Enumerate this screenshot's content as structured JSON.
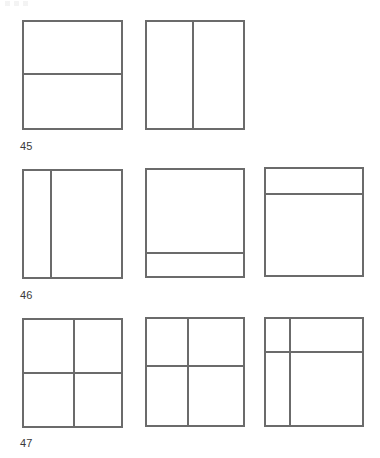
{
  "page": {
    "width": 380,
    "height": 458,
    "background_color": "#ffffff",
    "line_color": "#6b6b6b",
    "label_color": "#3a3a3a"
  },
  "rows": [
    {
      "label": "45",
      "label_x": 20,
      "label_y": 140,
      "figures": [
        {
          "name": "figure-45-a",
          "description": "square divided by one horizontal line into two horizontal bands",
          "x": 22,
          "y": 20,
          "width": 101,
          "height": 110,
          "dividers": [
            {
              "orientation": "horizontal",
              "position_pct": 48
            }
          ]
        },
        {
          "name": "figure-45-b",
          "description": "square divided by one vertical line into two vertical bands",
          "x": 145,
          "y": 20,
          "width": 100,
          "height": 110,
          "dividers": [
            {
              "orientation": "vertical",
              "position_pct": 47
            }
          ]
        }
      ]
    },
    {
      "label": "46",
      "label_x": 20,
      "label_y": 289,
      "figures": [
        {
          "name": "figure-46-a",
          "description": "square divided by one vertical line near the left edge",
          "x": 22,
          "y": 169,
          "width": 101,
          "height": 110,
          "dividers": [
            {
              "orientation": "vertical",
              "position_pct": 27
            }
          ]
        },
        {
          "name": "figure-46-b",
          "description": "square divided by one horizontal line near the bottom edge",
          "x": 145,
          "y": 168,
          "width": 100,
          "height": 110,
          "dividers": [
            {
              "orientation": "horizontal",
              "position_pct": 77
            }
          ]
        },
        {
          "name": "figure-46-c",
          "description": "square divided by one horizontal line near the top edge",
          "x": 264,
          "y": 167,
          "width": 100,
          "height": 110,
          "dividers": [
            {
              "orientation": "horizontal",
              "position_pct": 23
            }
          ]
        }
      ]
    },
    {
      "label": "47",
      "label_x": 20,
      "label_y": 437,
      "figures": [
        {
          "name": "figure-47-a",
          "description": "square divided into four quadrants by centred vertical and horizontal lines",
          "x": 22,
          "y": 318,
          "width": 101,
          "height": 110,
          "dividers": [
            {
              "orientation": "vertical",
              "position_pct": 50
            },
            {
              "orientation": "horizontal",
              "position_pct": 49
            }
          ]
        },
        {
          "name": "figure-47-b",
          "description": "square divided into four unequal parts, cross slightly left and above centre",
          "x": 145,
          "y": 317,
          "width": 100,
          "height": 110,
          "dividers": [
            {
              "orientation": "vertical",
              "position_pct": 42
            },
            {
              "orientation": "horizontal",
              "position_pct": 43
            }
          ]
        },
        {
          "name": "figure-47-c",
          "description": "square divided into four very unequal parts, cross near the top-left corner",
          "x": 264,
          "y": 317,
          "width": 100,
          "height": 110,
          "dividers": [
            {
              "orientation": "vertical",
              "position_pct": 24
            },
            {
              "orientation": "horizontal",
              "position_pct": 30
            }
          ]
        }
      ]
    }
  ]
}
